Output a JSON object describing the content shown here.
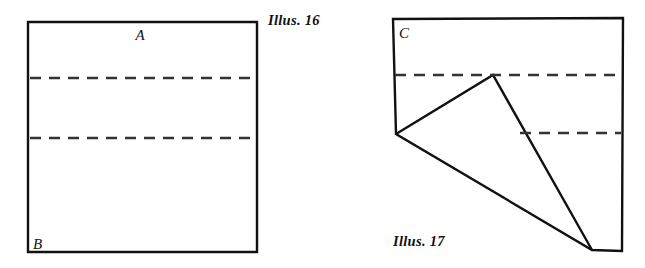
{
  "page": {
    "background_color": "#ffffff",
    "ink_color": "#111111",
    "dash_color": "#333333",
    "width": 645,
    "height": 268
  },
  "figures": [
    {
      "id": "illus-16",
      "caption": "Illus. 16",
      "description": "Square sheet of paper with two horizontal dashed fold lines",
      "labels": [
        {
          "name": "label-a",
          "text": "A"
        },
        {
          "name": "label-b",
          "text": "B"
        }
      ],
      "outline_points": "28,22 257,22 257,252 28,252",
      "dashed_lines": [
        {
          "name": "fold-line-upper",
          "x1": 30,
          "y1": 78,
          "x2": 256,
          "y2": 78
        },
        {
          "name": "fold-line-lower",
          "x1": 30,
          "y1": 138,
          "x2": 256,
          "y2": 138
        }
      ],
      "caption_position": {
        "x": 268,
        "y": 25
      }
    },
    {
      "id": "illus-17",
      "caption": "Illus. 17",
      "description": "Folded paper shape with a triangular flap turned down and two dashed fold lines",
      "labels": [
        {
          "name": "label-c",
          "text": "C"
        }
      ],
      "outline_points": "393,19 623,18 622,251 592,250 396,134",
      "fold_polyline": "396,134 493,75 592,250",
      "dashed_lines": [
        {
          "name": "fold-line-upper",
          "x1": 395,
          "y1": 75,
          "x2": 621,
          "y2": 75
        },
        {
          "name": "fold-line-lower",
          "x1": 520,
          "y1": 133,
          "x2": 621,
          "y2": 133
        }
      ],
      "caption_position": {
        "x": 393,
        "y": 246
      }
    }
  ]
}
